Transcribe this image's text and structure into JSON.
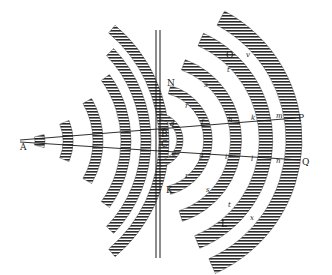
{
  "figure": {
    "colors": {
      "ink": "#1a1a1a",
      "background": "#ffffff",
      "hatch": "#2b2b2b"
    },
    "interface": {
      "x1": 156,
      "x2": 160,
      "y_top": 30,
      "y_bottom": 258
    },
    "source_point": {
      "label": "A",
      "x": 10,
      "y": 143
    },
    "rays": [
      {
        "from": "A",
        "to": "P",
        "x1": 20,
        "y1": 140,
        "x2": 296,
        "y2": 118
      },
      {
        "from": "A",
        "to": "Q",
        "x1": 20,
        "y1": 142,
        "x2": 300,
        "y2": 160
      }
    ],
    "incident_waves": [
      {
        "r": 22,
        "half_angle": 14
      },
      {
        "r": 50,
        "half_angle": 22
      },
      {
        "r": 80,
        "half_angle": 30
      },
      {
        "r": 108,
        "half_angle": 36
      },
      {
        "r": 128,
        "half_angle": 44
      },
      {
        "r": 146,
        "half_angle": 50
      }
    ],
    "refracted_waves": [
      {
        "cx": 162,
        "cy": 140,
        "r": 24
      },
      {
        "cx": 162,
        "cy": 140,
        "r": 52
      },
      {
        "cx": 162,
        "cy": 140,
        "r": 80
      },
      {
        "cx": 162,
        "cy": 140,
        "r": 110
      },
      {
        "cx": 162,
        "cy": 140,
        "r": 138
      }
    ],
    "labels": {
      "A": "A",
      "B": "B",
      "C": "C",
      "N": "N",
      "K": "K",
      "O": "O",
      "L": "L",
      "P": "P",
      "Q": "Q"
    },
    "wave_letters_upper": [
      "d",
      "f",
      "h",
      "k",
      "m"
    ],
    "wave_letters_lower": [
      "e",
      "g",
      "i",
      "l",
      "n"
    ],
    "wave_letters_arc_upper": [
      "r",
      "s",
      "t",
      "v",
      "y"
    ],
    "wave_letters_arc_lower": [
      "r",
      "s",
      "t",
      "v",
      "x"
    ]
  }
}
